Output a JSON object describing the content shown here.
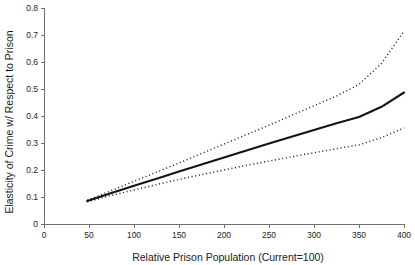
{
  "chart_data": {
    "type": "line",
    "title": "",
    "xlabel": "Relative Prison Population (Current=100)",
    "ylabel": "Elasticity of Crime w/ Respect to Prison",
    "xlim": [
      0,
      400
    ],
    "ylim": [
      0,
      0.8
    ],
    "grid": false,
    "legend_position": "none",
    "xticks": [
      0,
      50,
      100,
      150,
      200,
      250,
      300,
      350,
      400
    ],
    "xtick_labels": [
      "0",
      "50",
      "100",
      "150",
      "200",
      "250",
      "300",
      "350",
      "400"
    ],
    "yticks": [
      0,
      0.1,
      0.2,
      0.3,
      0.4,
      0.5,
      0.6,
      0.7,
      0.8
    ],
    "ytick_labels": [
      "0",
      "0.1",
      "0.2",
      "0.3",
      "0.4",
      "0.5",
      "0.6",
      "0.7",
      "0.8"
    ],
    "x": [
      48,
      75,
      100,
      125,
      150,
      175,
      200,
      225,
      250,
      275,
      300,
      325,
      350,
      375,
      400
    ],
    "series": [
      {
        "name": "Estimated elasticity",
        "style": "solid",
        "color": "#141414",
        "values": [
          0.085,
          0.115,
          0.142,
          0.168,
          0.194,
          0.22,
          0.246,
          0.272,
          0.298,
          0.323,
          0.348,
          0.373,
          0.396,
          0.434,
          0.487
        ]
      },
      {
        "name": "Upper confidence band",
        "style": "dotted",
        "color": "#2b2b2b",
        "values": [
          0.088,
          0.124,
          0.158,
          0.192,
          0.226,
          0.261,
          0.296,
          0.331,
          0.366,
          0.402,
          0.438,
          0.474,
          0.517,
          0.595,
          0.714
        ]
      },
      {
        "name": "Lower confidence band",
        "style": "dotted",
        "color": "#2b2b2b",
        "values": [
          0.082,
          0.106,
          0.126,
          0.146,
          0.165,
          0.183,
          0.2,
          0.217,
          0.233,
          0.249,
          0.264,
          0.279,
          0.293,
          0.32,
          0.356
        ]
      }
    ]
  }
}
